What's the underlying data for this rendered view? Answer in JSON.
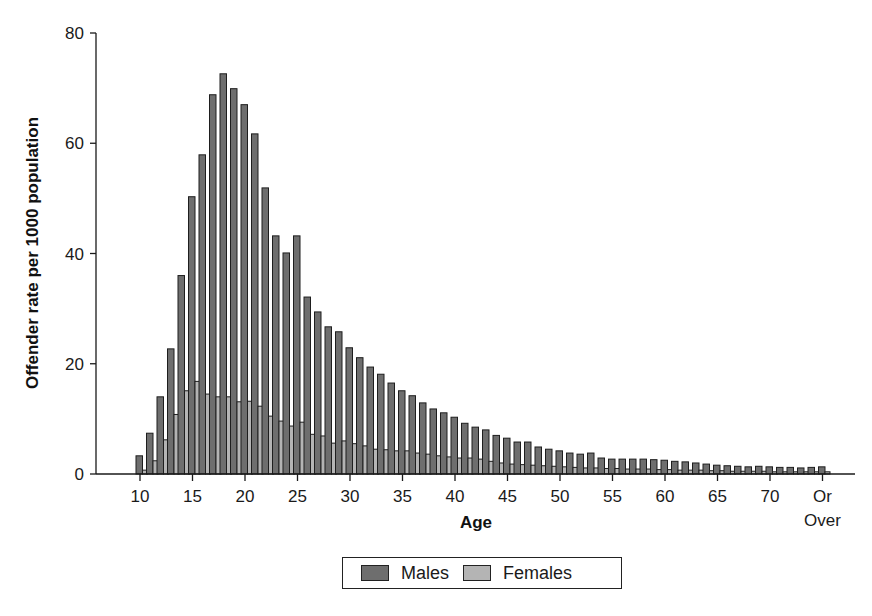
{
  "chart_data": {
    "type": "bar",
    "title": "",
    "xlabel": "Age",
    "ylabel": "Offender rate per 1000 population",
    "ylim": [
      0,
      80
    ],
    "yticks": [
      0,
      20,
      40,
      60,
      80
    ],
    "xtick_labels": [
      {
        "age": 10,
        "label": "10"
      },
      {
        "age": 15,
        "label": "15"
      },
      {
        "age": 20,
        "label": "20"
      },
      {
        "age": 25,
        "label": "25"
      },
      {
        "age": 30,
        "label": "30"
      },
      {
        "age": 35,
        "label": "35"
      },
      {
        "age": 40,
        "label": "40"
      },
      {
        "age": 45,
        "label": "45"
      },
      {
        "age": 50,
        "label": "50"
      },
      {
        "age": 55,
        "label": "55"
      },
      {
        "age": 60,
        "label": "60"
      },
      {
        "age": 65,
        "label": "65"
      },
      {
        "age": 70,
        "label": "70"
      },
      {
        "age": 75,
        "label": "Or\nOver"
      }
    ],
    "grid": false,
    "legend_position": "bottom",
    "categories": [
      10,
      11,
      12,
      13,
      14,
      15,
      16,
      17,
      18,
      19,
      20,
      21,
      22,
      23,
      24,
      25,
      26,
      27,
      28,
      29,
      30,
      31,
      32,
      33,
      34,
      35,
      36,
      37,
      38,
      39,
      40,
      41,
      42,
      43,
      44,
      45,
      46,
      47,
      48,
      49,
      50,
      51,
      52,
      53,
      54,
      55,
      56,
      57,
      58,
      59,
      60,
      61,
      62,
      63,
      64,
      65,
      66,
      67,
      68,
      69,
      70,
      71,
      72,
      73,
      74,
      "75 or over"
    ],
    "series": [
      {
        "name": "Males",
        "color": "#6e6e6e",
        "values": [
          3.3,
          7.4,
          14.0,
          22.7,
          36.0,
          50.3,
          57.9,
          68.8,
          72.6,
          69.9,
          67.0,
          61.7,
          51.9,
          43.2,
          40.1,
          43.2,
          32.1,
          29.4,
          26.7,
          25.8,
          22.9,
          21.1,
          19.4,
          18.1,
          16.5,
          15.1,
          14.2,
          12.9,
          11.8,
          11.1,
          10.3,
          9.2,
          8.5,
          8.0,
          7.0,
          6.5,
          5.8,
          5.8,
          4.9,
          4.5,
          4.2,
          3.8,
          3.6,
          3.8,
          2.9,
          2.7,
          2.7,
          2.7,
          2.7,
          2.6,
          2.5,
          2.3,
          2.2,
          2.0,
          1.8,
          1.6,
          1.5,
          1.4,
          1.3,
          1.4,
          1.3,
          1.2,
          1.2,
          1.1,
          1.2,
          1.3
        ]
      },
      {
        "name": "Females",
        "color": "#b4b4b4",
        "values": [
          0.7,
          2.4,
          6.2,
          10.8,
          15.1,
          16.8,
          14.5,
          14.0,
          14.0,
          13.1,
          13.2,
          12.3,
          10.5,
          9.6,
          8.7,
          9.4,
          7.2,
          6.9,
          5.6,
          6.0,
          5.5,
          5.1,
          4.5,
          4.4,
          4.2,
          4.2,
          3.8,
          3.6,
          3.3,
          3.1,
          2.9,
          2.9,
          2.7,
          2.3,
          2.0,
          1.8,
          1.7,
          1.6,
          1.5,
          1.4,
          1.3,
          1.2,
          1.1,
          1.1,
          1.0,
          1.0,
          0.9,
          0.9,
          0.9,
          0.8,
          0.8,
          0.7,
          0.7,
          0.7,
          0.6,
          0.6,
          0.5,
          0.5,
          0.5,
          0.5,
          0.4,
          0.4,
          0.4,
          0.4,
          0.4,
          0.4
        ]
      }
    ]
  },
  "legend": {
    "items": [
      {
        "label": "Males",
        "color": "#6e6e6e"
      },
      {
        "label": "Females",
        "color": "#b4b4b4"
      }
    ]
  },
  "colors": {
    "axis": "#1a1a1a",
    "bar_outline": "#1e1e1e"
  }
}
